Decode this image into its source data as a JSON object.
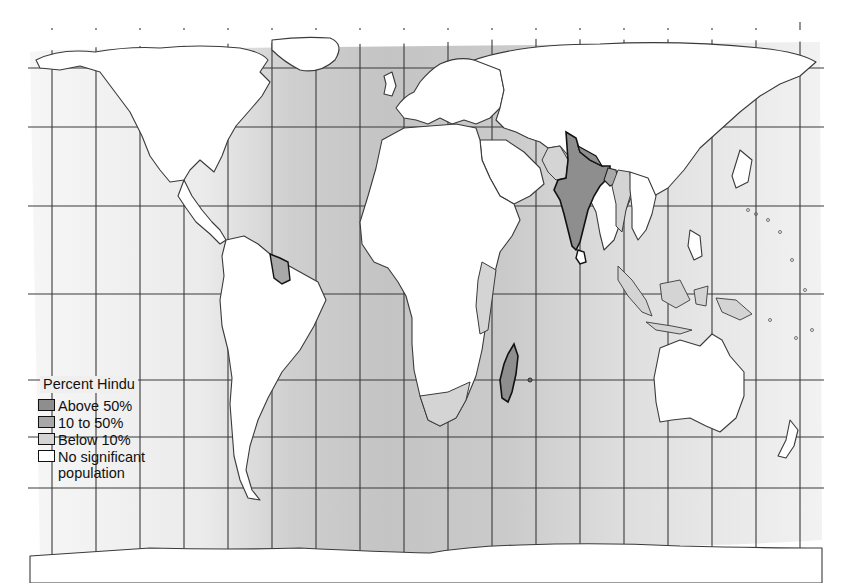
{
  "map": {
    "title": "Percent Hindu",
    "projection": "world map with graticule",
    "ocean_colors": {
      "edge": "#f4f4f4",
      "center": "#c6c6c6"
    },
    "highlighted_regions": {
      "above_50": [
        "India",
        "Nepal",
        "Madagascar",
        "Mauritius"
      ],
      "10_to_50": [
        "Bangladesh",
        "Guyana",
        "Suriname",
        "Fiji",
        "Bhutan",
        "Sri Lanka"
      ],
      "below_10": [
        "Pakistan",
        "Myanmar",
        "Malaysia",
        "Indonesia",
        "Southern Africa",
        "East Africa",
        "Persian Gulf states",
        "Trinidad and Tobago"
      ]
    }
  },
  "legend": {
    "title": "Percent Hindu",
    "items": [
      {
        "label": "Above 50%",
        "color": "#8e8e8e"
      },
      {
        "label": "10 to 50%",
        "color": "#a8a8a8"
      },
      {
        "label": "Below 10%",
        "color": "#d4d4d4"
      },
      {
        "label": "No significant",
        "label2": "population",
        "color": "#ffffff"
      }
    ]
  }
}
